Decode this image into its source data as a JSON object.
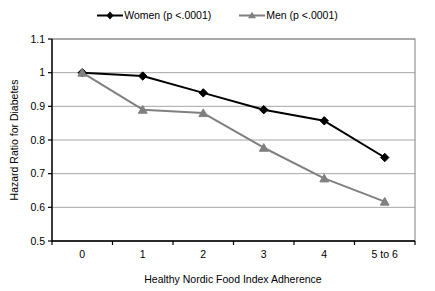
{
  "chart_data": {
    "type": "line",
    "title": "",
    "xlabel": "Healthy Nordic Food Index Adherence",
    "ylabel": "Hazard Ratio for Diabetes",
    "categories": [
      "0",
      "1",
      "2",
      "3",
      "4",
      "5 to 6"
    ],
    "ylim": [
      0.5,
      1.1
    ],
    "yticks": [
      "0.5",
      "0.6",
      "0.7",
      "0.8",
      "0.9",
      "1",
      "1.1"
    ],
    "ytick_values": [
      0.5,
      0.6,
      0.7,
      0.8,
      0.9,
      1.0,
      1.1
    ],
    "grid": "horizontal",
    "legend_position": "top-center",
    "series": [
      {
        "name": "Women (p <.0001)",
        "color": "#000000",
        "marker": "diamond",
        "values": [
          1.0,
          0.99,
          0.94,
          0.89,
          0.857,
          0.748
        ]
      },
      {
        "name": "Men (p <.0001)",
        "color": "#808080",
        "marker": "triangle",
        "values": [
          1.0,
          0.89,
          0.88,
          0.777,
          0.686,
          0.617
        ]
      }
    ]
  },
  "legend": {
    "entries": [
      {
        "label": "Women (p <.0001)"
      },
      {
        "label": "Men (p <.0001)"
      }
    ]
  },
  "axes": {
    "y_title": "Hazard Ratio for Diabetes",
    "x_title": "Healthy Nordic Food Index Adherence"
  },
  "colors": {
    "women": "#000000",
    "men": "#808080",
    "gridline": "#a6a6a6",
    "axis": "#000000",
    "plot_border": "#808080",
    "background": "#ffffff"
  }
}
